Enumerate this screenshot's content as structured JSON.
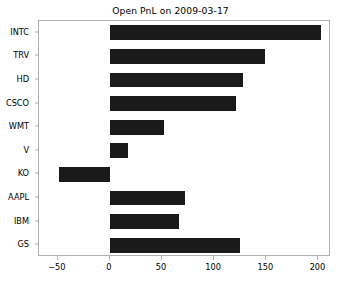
{
  "chart_data": {
    "type": "bar",
    "orientation": "horizontal",
    "title": "Open PnL on 2009-03-17",
    "xlabel": "",
    "ylabel": "",
    "categories": [
      "INTC",
      "TRV",
      "HD",
      "CSCO",
      "WMT",
      "V",
      "KO",
      "AAPL",
      "IBM",
      "GS"
    ],
    "values": [
      202,
      149,
      128,
      121,
      52,
      17,
      -49,
      72,
      66,
      125
    ],
    "xlim": [
      -68,
      212
    ],
    "xticks": [
      -50,
      0,
      50,
      100,
      150,
      200
    ],
    "xticklabels": [
      "−50",
      "0",
      "50",
      "100",
      "150",
      "200"
    ],
    "grid": false,
    "legend": null,
    "bar_color": "#1a1a1a",
    "frame_color": "#b0b0b0",
    "background_color": "#ffffff"
  }
}
